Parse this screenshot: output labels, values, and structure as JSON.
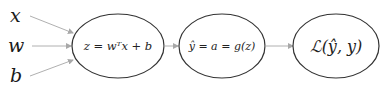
{
  "diagram": {
    "inputs": [
      {
        "id": "x",
        "label": "x"
      },
      {
        "id": "w",
        "label": "w"
      },
      {
        "id": "b",
        "label": "b"
      }
    ],
    "nodes": [
      {
        "id": "linear",
        "label": "z = wᵀx + b"
      },
      {
        "id": "activation",
        "label": "ŷ = a = g(z)"
      },
      {
        "id": "loss",
        "label": "ℒ(ŷ, y)"
      }
    ],
    "edges": [
      {
        "from": "x",
        "to": "linear"
      },
      {
        "from": "w",
        "to": "linear"
      },
      {
        "from": "b",
        "to": "linear"
      },
      {
        "from": "linear",
        "to": "activation"
      },
      {
        "from": "activation",
        "to": "loss"
      }
    ],
    "colors": {
      "ellipse_stroke": "#333333",
      "arrow": "#b0b0b0",
      "text": "#222222",
      "background": "#ffffff"
    }
  }
}
